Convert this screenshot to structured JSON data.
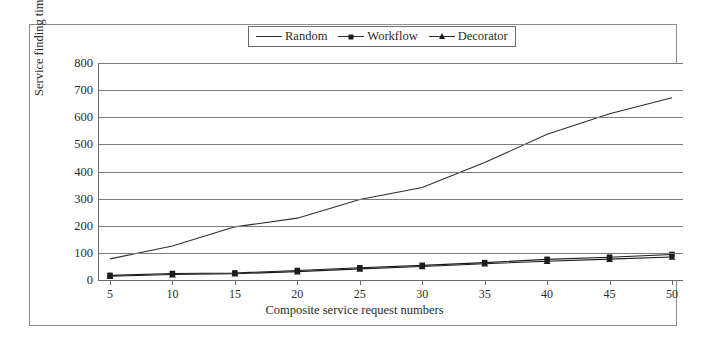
{
  "chart_data": {
    "type": "line",
    "title": "",
    "xlabel": "Composite service request numbers",
    "ylabel": "Service finding time (s)",
    "x": [
      5,
      10,
      15,
      20,
      25,
      30,
      35,
      40,
      45,
      50
    ],
    "xtick_labels": [
      "5",
      "10",
      "15",
      "20",
      "25",
      "30",
      "35",
      "40",
      "45",
      "50"
    ],
    "ytick_labels": [
      "0",
      "100",
      "200",
      "300",
      "400",
      "500",
      "600",
      "700",
      "800"
    ],
    "yticks": [
      0,
      100,
      200,
      300,
      400,
      500,
      600,
      700,
      800
    ],
    "ylim": [
      0,
      800
    ],
    "xlim": [
      5,
      50
    ],
    "grid": "horizontal",
    "legend_position": "top-center",
    "series": [
      {
        "name": "Random",
        "marker": "none",
        "color": "#2e2e2e",
        "values": [
          78,
          125,
          196,
          228,
          297,
          341,
          433,
          537,
          613,
          672
        ]
      },
      {
        "name": "Workflow",
        "marker": "square",
        "color": "#1c1c1c",
        "values": [
          17,
          24,
          26,
          35,
          45,
          54,
          64,
          76,
          84,
          94
        ]
      },
      {
        "name": "Decorator",
        "marker": "triangle",
        "color": "#1c1c1c",
        "values": [
          14,
          20,
          23,
          31,
          41,
          50,
          60,
          69,
          77,
          85
        ]
      }
    ]
  },
  "legend": {
    "items": [
      {
        "label": "Random",
        "marker": "none"
      },
      {
        "label": "Workflow",
        "marker": "square"
      },
      {
        "label": "Decorator",
        "marker": "triangle"
      }
    ]
  }
}
